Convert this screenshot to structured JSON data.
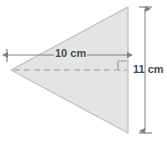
{
  "diagram": {
    "shape": {
      "name": "triangle",
      "fill_color": "#e4e4e4",
      "stroke_color": "#b6b6b6",
      "vertices": [
        {
          "x": 11,
          "y": 70
        },
        {
          "x": 128,
          "y": 7
        },
        {
          "x": 128,
          "y": 133
        }
      ]
    },
    "centerline": {
      "name": "dashed-height-line",
      "style": "dashed",
      "color": "#9a9a9a",
      "from": {
        "x": 13,
        "y": 70
      },
      "to": {
        "x": 128,
        "y": 70
      }
    },
    "right_angle_marker": {
      "name": "right-angle-marker",
      "color": "#9a9a9a",
      "size": 9
    },
    "dimensions": [
      {
        "id": "base",
        "label": "10 cm",
        "value": 10,
        "unit": "cm",
        "orientation": "horizontal",
        "color": "#808080",
        "from": {
          "x": 7,
          "y": 55
        },
        "to": {
          "x": 128,
          "y": 55
        }
      },
      {
        "id": "height",
        "label": "11 cm",
        "value": 11,
        "unit": "cm",
        "orientation": "vertical",
        "color": "#808080",
        "from": {
          "x": 145,
          "y": 7
        },
        "to": {
          "x": 145,
          "y": 133
        }
      }
    ]
  }
}
